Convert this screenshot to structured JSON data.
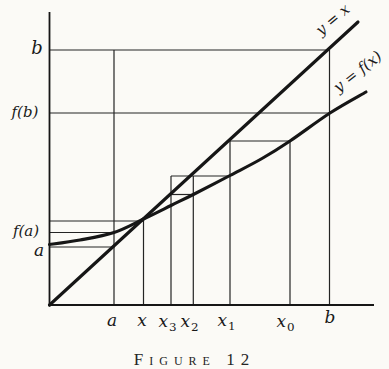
{
  "figure": {
    "caption": "Figure 12"
  },
  "colors": {
    "paper": "#fbfaf6",
    "ink": "#161616",
    "construction_ink": "#242424"
  },
  "chart_data": {
    "type": "line",
    "caption": "Figure 12",
    "x_tick_labels": [
      "a",
      "x",
      "x3",
      "x2",
      "x1",
      "x0",
      "b"
    ],
    "y_tick_labels": [
      "b",
      "f(b)",
      "f(a)",
      "a"
    ],
    "curve_labels": [
      "y = x",
      "y = f(x)"
    ],
    "math": {
      "relation": "x_{n+1} = f(x_n), iterates x0 > x1 > x2 > x3 converge to fixed point x where y = f(x) crosses y = x",
      "x_values_units_of_b": {
        "a": 0.23,
        "x_fixed": 0.335,
        "x3": 0.433,
        "x2": 0.513,
        "x1": 0.643,
        "x0": 0.857,
        "b": 1.0
      },
      "y_values_units_of_b": {
        "a": 0.23,
        "f_of_a": 0.284,
        "x_fixed": 0.335,
        "f_of_b": 0.757,
        "b": 1.0
      }
    },
    "pixel_geometry": {
      "canvas": [
        389,
        359
      ],
      "axes": {
        "y_axis": [
          49.5,
          12,
          49.5,
          306.5
        ],
        "x_axis": [
          48,
          305,
          374,
          305
        ]
      },
      "identity_line": [
        [
          49.5,
          305
        ],
        [
          358,
          22
        ]
      ],
      "curve_points": [
        [
          49.5,
          244.5
        ],
        [
          80,
          240
        ],
        [
          114,
          232.5
        ],
        [
          143.5,
          219
        ],
        [
          171,
          205.5
        ],
        [
          193.3,
          194.5
        ],
        [
          230,
          175.5
        ],
        [
          262,
          158.5
        ],
        [
          290,
          141
        ],
        [
          330,
          113
        ],
        [
          366,
          92
        ]
      ],
      "construction_lines": [
        {
          "name": "level-b",
          "pts": [
            49.5,
            50,
            329.5,
            50
          ]
        },
        {
          "name": "level-f-of-b",
          "pts": [
            49.5,
            113,
            331,
            113
          ]
        },
        {
          "name": "level-fixed-point",
          "pts": [
            49.5,
            221,
            143.5,
            221
          ]
        },
        {
          "name": "level-f-of-a",
          "pts": [
            49.5,
            232.5,
            114,
            232.5
          ]
        },
        {
          "name": "level-a",
          "pts": [
            49.5,
            247,
            114.5,
            247
          ]
        },
        {
          "name": "step-x1-x0",
          "pts": [
            230,
            141,
            290,
            141
          ]
        },
        {
          "name": "step-x2-x1",
          "pts": [
            171,
            176,
            230,
            176
          ]
        },
        {
          "name": "step-x3-x2",
          "pts": [
            171,
            194.5,
            193.3,
            194.5
          ]
        },
        {
          "name": "vertical-a",
          "pts": [
            114,
            50,
            114,
            305
          ]
        },
        {
          "name": "vertical-b",
          "pts": [
            329.5,
            50,
            329.5,
            305
          ]
        },
        {
          "name": "vertical-x-fixed",
          "pts": [
            143.5,
            219,
            143.5,
            305
          ]
        },
        {
          "name": "vertical-x3",
          "pts": [
            171,
            176,
            171,
            305
          ]
        },
        {
          "name": "vertical-x2",
          "pts": [
            193.3,
            176,
            193.3,
            305
          ]
        },
        {
          "name": "vertical-x1",
          "pts": [
            230,
            141,
            230,
            305
          ]
        },
        {
          "name": "vertical-x0",
          "pts": [
            290,
            141,
            290,
            305
          ]
        }
      ],
      "labels": [
        {
          "name": "y-axis-label-b",
          "text": "b",
          "x": 37,
          "y": 48,
          "size": 18
        },
        {
          "name": "y-axis-label-fb",
          "text": "f(b)",
          "x": 25,
          "y": 112,
          "size": 15
        },
        {
          "name": "y-axis-label-fa",
          "text": "f(a)",
          "x": 26,
          "y": 231,
          "size": 15
        },
        {
          "name": "y-axis-label-a",
          "text": "a",
          "x": 39,
          "y": 250,
          "size": 17
        },
        {
          "name": "x-axis-label-a",
          "text": "a",
          "x": 112,
          "y": 320,
          "size": 17
        },
        {
          "name": "x-axis-label-x",
          "text": "x",
          "x": 142,
          "y": 320,
          "size": 17
        },
        {
          "name": "x-axis-label-x3",
          "text": "x",
          "sub": "3",
          "x": 167,
          "y": 321,
          "size": 17
        },
        {
          "name": "x-axis-label-x2",
          "text": "x",
          "sub": "2",
          "x": 189,
          "y": 321,
          "size": 17
        },
        {
          "name": "x-axis-label-x1",
          "text": "x",
          "sub": "1",
          "x": 226,
          "y": 320,
          "size": 17
        },
        {
          "name": "x-axis-label-x0",
          "text": "x",
          "sub": "0",
          "x": 285,
          "y": 321,
          "size": 17
        },
        {
          "name": "x-axis-label-b",
          "text": "b",
          "x": 330,
          "y": 317,
          "size": 17
        },
        {
          "name": "line-label-y-equals-x",
          "text": "y = x",
          "x": 333,
          "y": 20,
          "size": 15,
          "rotate": -40
        },
        {
          "name": "line-label-y-equals-fx",
          "text": "y = f(x)",
          "x": 358,
          "y": 72,
          "size": 15,
          "rotate": -38
        }
      ]
    }
  }
}
